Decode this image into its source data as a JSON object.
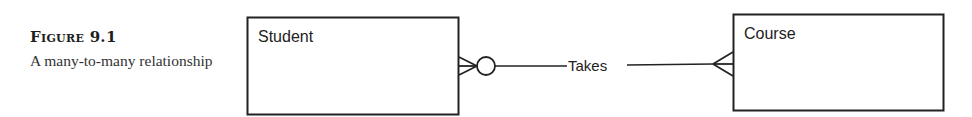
{
  "figure": {
    "title": "Figure 9.1",
    "description": "A many-to-many relationship"
  },
  "diagram": {
    "entities": [
      {
        "name": "Student"
      },
      {
        "name": "Course"
      }
    ],
    "relationship": {
      "label": "Takes",
      "left_end": "zero-or-many",
      "right_end": "one-or-many"
    },
    "colors": {
      "stroke": "#222222",
      "background": "#ffffff"
    }
  }
}
